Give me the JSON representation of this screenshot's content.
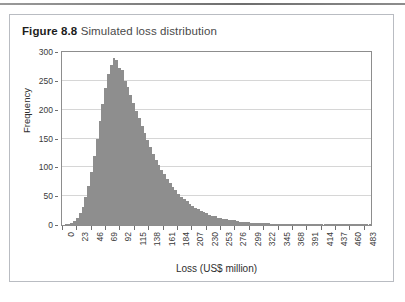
{
  "figure": {
    "number_label": "Figure 8.8",
    "caption": "Simulated loss distribution",
    "frame_color": "#b9bcc2"
  },
  "chart_data": {
    "type": "bar",
    "title": "Simulated loss distribution",
    "xlabel": "Loss (US$ million)",
    "ylabel": "Frequency",
    "xlim": [
      0,
      494.5
    ],
    "ylim": [
      0,
      300
    ],
    "grid": "horizontal",
    "legend": "none",
    "bar_color": "#8e8e8e",
    "ytick_labels": [
      "0",
      "50",
      "100",
      "150",
      "200",
      "250",
      "300"
    ],
    "ytick_values": [
      0,
      50,
      100,
      150,
      200,
      250,
      300
    ],
    "xtick_labels": [
      "0",
      "23",
      "46",
      "69",
      "92",
      "115",
      "138",
      "161",
      "184",
      "207",
      "230",
      "253",
      "276",
      "299",
      "322",
      "345",
      "368",
      "391",
      "414",
      "437",
      "460",
      "483"
    ],
    "xtick_values": [
      0,
      23,
      46,
      69,
      92,
      115,
      138,
      161,
      184,
      207,
      230,
      253,
      276,
      299,
      322,
      345,
      368,
      391,
      414,
      437,
      460,
      483
    ],
    "bin_width": 4.5,
    "x": [
      0,
      4.5,
      9,
      13.5,
      18,
      22.5,
      27,
      31.5,
      36,
      40.5,
      45,
      49.5,
      54,
      58.5,
      63,
      67.5,
      72,
      76.5,
      81,
      85.5,
      90,
      94.5,
      99,
      103.5,
      108,
      112.5,
      117,
      121.5,
      126,
      130.5,
      135,
      139.5,
      144,
      148.5,
      153,
      157.5,
      162,
      166.5,
      171,
      175.5,
      180,
      184.5,
      189,
      193.5,
      198,
      202.5,
      207,
      211.5,
      216,
      220.5,
      225,
      229.5,
      234,
      238.5,
      243,
      247.5,
      252,
      256.5,
      261,
      265.5,
      270,
      274.5,
      279,
      283.5,
      288,
      292.5,
      297,
      301.5,
      306,
      310.5,
      315,
      319.5,
      324,
      328.5,
      333,
      337.5,
      342,
      346.5,
      351,
      355.5,
      360,
      364.5,
      369,
      373.5,
      378,
      382.5,
      387,
      391.5,
      396,
      400.5,
      405,
      409.5,
      414,
      418.5,
      423,
      427.5,
      432,
      436.5,
      441,
      445.5,
      450,
      454.5,
      459,
      463.5,
      468,
      472.5,
      477,
      481.5,
      486,
      490.5
    ],
    "values": [
      0,
      1,
      2,
      4,
      7,
      12,
      20,
      32,
      48,
      68,
      92,
      120,
      150,
      180,
      210,
      238,
      262,
      278,
      290,
      286,
      272,
      268,
      250,
      240,
      225,
      212,
      198,
      186,
      172,
      160,
      148,
      136,
      124,
      113,
      104,
      96,
      88,
      80,
      72,
      66,
      60,
      54,
      49,
      45,
      41,
      37,
      33,
      30,
      27,
      25,
      22,
      20,
      18,
      16,
      15,
      13,
      12,
      11,
      10,
      9,
      8,
      8,
      7,
      6,
      6,
      5,
      5,
      4,
      4,
      4,
      3,
      3,
      3,
      3,
      2,
      2,
      2,
      2,
      2,
      2,
      2,
      1,
      1,
      1,
      1,
      1,
      1,
      1,
      1,
      1,
      1,
      1,
      1,
      1,
      1,
      1,
      1,
      1,
      1,
      1,
      1,
      1,
      1,
      1,
      1,
      1,
      1,
      1,
      1,
      1
    ],
    "peak_frequency": 290,
    "peak_loss": 81
  }
}
